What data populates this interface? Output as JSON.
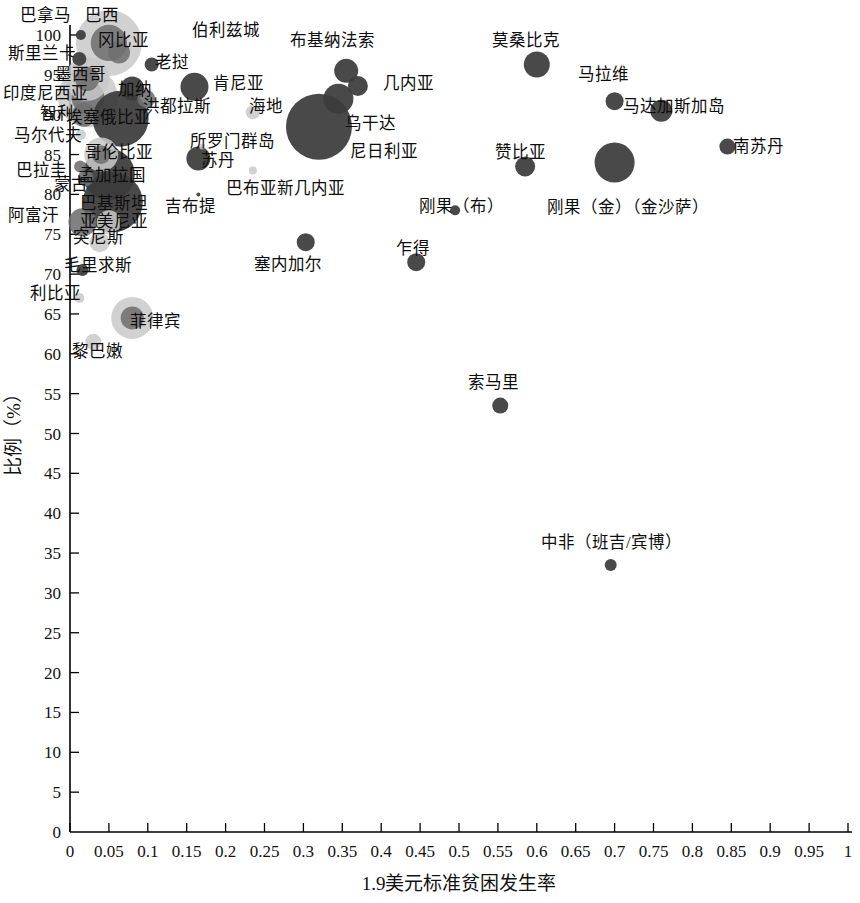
{
  "chart_data": {
    "type": "scatter",
    "title": "",
    "xlabel": "1.9美元标准贫困发生率",
    "ylabel": "比例（%）",
    "xlim": [
      0,
      1
    ],
    "ylim": [
      0,
      100
    ],
    "xticks": [
      "0",
      "0.05",
      "0.1",
      "0.15",
      "0.2",
      "0.25",
      "0.3",
      "0.35",
      "0.4",
      "0.45",
      "0.5",
      "0.55",
      "0.6",
      "0.65",
      "0.7",
      "0.75",
      "0.8",
      "0.85",
      "0.9",
      "0.95",
      "1"
    ],
    "yticks": [
      "0",
      "5",
      "10",
      "15",
      "20",
      "25",
      "30",
      "35",
      "40",
      "45",
      "50",
      "55",
      "60",
      "65",
      "70",
      "75",
      "80",
      "85",
      "90",
      "95",
      "100"
    ],
    "grid": false,
    "legend": "none",
    "bubble_note": "Bubble area encodes an unlabeled third magnitude (population scale); shades: dark, mid, light gray",
    "points": [
      {
        "label": "巴拿马",
        "x": 0.014,
        "y": 100.0,
        "r": 5,
        "shade": "dark",
        "lx": 20,
        "ly": 8
      },
      {
        "label": "巴西",
        "x": 0.05,
        "y": 99.0,
        "r": 33,
        "shade": "light",
        "lx": 85,
        "ly": 8
      },
      {
        "label": "冈比亚",
        "x": 0.063,
        "y": 97.8,
        "r": 11,
        "shade": "mid",
        "lx": 98,
        "ly": 33
      },
      {
        "label": "伯利兹城",
        "x": 0.335,
        "y": 99.0,
        "r": 3,
        "shade": "light",
        "lx": 192,
        "ly": 23
      },
      {
        "label": "布基纳法索",
        "x": 0.355,
        "y": 95.5,
        "r": 12,
        "shade": "dark",
        "lx": 290,
        "ly": 33
      },
      {
        "label": "莫桑比克",
        "x": 0.6,
        "y": 96.3,
        "r": 13,
        "shade": "dark",
        "lx": 492,
        "ly": 33
      },
      {
        "label": "斯里兰卡",
        "x": 0.012,
        "y": 97.0,
        "r": 7,
        "shade": "dark",
        "lx": 8,
        "ly": 46
      },
      {
        "label": "老挝",
        "x": 0.105,
        "y": 96.3,
        "r": 7,
        "shade": "dark",
        "lx": 155,
        "ly": 55
      },
      {
        "label": "几内亚",
        "x": 0.37,
        "y": 93.6,
        "r": 10,
        "shade": "dark",
        "lx": 383,
        "ly": 76
      },
      {
        "label": "马拉维",
        "x": 0.7,
        "y": 91.7,
        "r": 9,
        "shade": "dark",
        "lx": 578,
        "ly": 67
      },
      {
        "label": "墨西哥",
        "x": 0.022,
        "y": 94.5,
        "r": 22,
        "shade": "light",
        "lx": 55,
        "ly": 67
      },
      {
        "label": "肯尼亚",
        "x": 0.16,
        "y": 93.5,
        "r": 14,
        "shade": "dark",
        "lx": 213,
        "ly": 76
      },
      {
        "label": "加纳",
        "x": 0.08,
        "y": 93.3,
        "r": 12,
        "shade": "dark",
        "lx": 118,
        "ly": 82
      },
      {
        "label": "印度尼西亚",
        "x": 0.023,
        "y": 92.2,
        "r": 30,
        "shade": "light",
        "lx": 3,
        "ly": 86
      },
      {
        "label": "洪都拉斯",
        "x": 0.098,
        "y": 92.0,
        "r": 9,
        "shade": "mid",
        "lx": 143,
        "ly": 99
      },
      {
        "label": "海地",
        "x": 0.235,
        "y": 90.3,
        "r": 7,
        "shade": "light",
        "lx": 249,
        "ly": 99
      },
      {
        "label": "马达加斯加岛",
        "x": 0.76,
        "y": 90.5,
        "r": 11,
        "shade": "dark",
        "lx": 623,
        "ly": 99
      },
      {
        "label": "智利",
        "x": 0.018,
        "y": 90.0,
        "r": 12,
        "shade": "mid",
        "lx": 40,
        "ly": 106
      },
      {
        "label": "乌干达",
        "x": 0.345,
        "y": 92.0,
        "r": 15,
        "shade": "dark",
        "lx": 345,
        "ly": 116
      },
      {
        "label": "埃塞俄比亚",
        "x": 0.065,
        "y": 89.5,
        "r": 28,
        "shade": "dark",
        "lx": 66,
        "ly": 110
      },
      {
        "label": "尼日利亚",
        "x": 0.32,
        "y": 88.5,
        "r": 33,
        "shade": "dark",
        "lx": 350,
        "ly": 144
      },
      {
        "label": "南苏丹",
        "x": 0.845,
        "y": 86.0,
        "r": 8,
        "shade": "dark",
        "lx": 733,
        "ly": 139
      },
      {
        "label": "马尔代夫",
        "x": 0.014,
        "y": 87.5,
        "r": 5,
        "shade": "light",
        "lx": 14,
        "ly": 128
      },
      {
        "label": "所罗门群岛",
        "x": 0.17,
        "y": 86.0,
        "r": 3,
        "shade": "light",
        "lx": 190,
        "ly": 134
      },
      {
        "label": "赞比亚",
        "x": 0.585,
        "y": 83.5,
        "r": 10,
        "shade": "dark",
        "lx": 495,
        "ly": 145
      },
      {
        "label": "哥伦比亚",
        "x": 0.04,
        "y": 85.0,
        "r": 17,
        "shade": "light",
        "lx": 85,
        "ly": 145
      },
      {
        "label": "苏丹",
        "x": 0.165,
        "y": 84.5,
        "r": 12,
        "shade": "dark",
        "lx": 201,
        "ly": 153
      },
      {
        "label": "刚果（金）（金沙萨）",
        "x": 0.7,
        "y": 84.0,
        "r": 20,
        "shade": "dark",
        "lx": 547,
        "ly": 200
      },
      {
        "label": "巴拉圭",
        "x": 0.013,
        "y": 83.5,
        "r": 6,
        "shade": "mid",
        "lx": 16,
        "ly": 163
      },
      {
        "label": "蒙古",
        "x": 0.02,
        "y": 82.0,
        "r": 8,
        "shade": "mid",
        "lx": 54,
        "ly": 177
      },
      {
        "label": "孟加拉国",
        "x": 0.05,
        "y": 82.5,
        "r": 26,
        "shade": "dark",
        "lx": 78,
        "ly": 168
      },
      {
        "label": "巴布亚新几内亚",
        "x": 0.235,
        "y": 83.0,
        "r": 4,
        "shade": "light",
        "lx": 226,
        "ly": 181
      },
      {
        "label": "巴基斯坦",
        "x": 0.055,
        "y": 79.0,
        "r": 30,
        "shade": "dark",
        "lx": 80,
        "ly": 196
      },
      {
        "label": "吉布提",
        "x": 0.165,
        "y": 80.0,
        "r": 2,
        "shade": "dark",
        "lx": 165,
        "ly": 199
      },
      {
        "label": "刚果（布）",
        "x": 0.495,
        "y": 78.0,
        "r": 5,
        "shade": "dark",
        "lx": 419,
        "ly": 199
      },
      {
        "label": "阿富汗",
        "x": 0.016,
        "y": 76.5,
        "r": 14,
        "shade": "mid",
        "lx": 8,
        "ly": 208
      },
      {
        "label": "亚美尼亚",
        "x": 0.05,
        "y": 76.5,
        "r": 12,
        "shade": "light",
        "lx": 80,
        "ly": 214
      },
      {
        "label": "突尼斯",
        "x": 0.038,
        "y": 74.0,
        "r": 10,
        "shade": "light",
        "lx": 73,
        "ly": 230
      },
      {
        "label": "塞内加尔",
        "x": 0.303,
        "y": 74.0,
        "r": 9,
        "shade": "dark",
        "lx": 254,
        "ly": 257
      },
      {
        "label": "乍得",
        "x": 0.445,
        "y": 71.5,
        "r": 9,
        "shade": "dark",
        "lx": 396,
        "ly": 241
      },
      {
        "label": "毛里求斯",
        "x": 0.016,
        "y": 70.5,
        "r": 6,
        "shade": "dark",
        "lx": 64,
        "ly": 258
      },
      {
        "label": "利比亚",
        "x": 0.012,
        "y": 67.0,
        "r": 5,
        "shade": "light",
        "lx": 30,
        "ly": 286
      },
      {
        "label": "菲律宾",
        "x": 0.08,
        "y": 64.5,
        "r": 21,
        "shade": "light",
        "lx": 130,
        "ly": 314
      },
      {
        "label": "黎巴嫩",
        "x": 0.03,
        "y": 61.5,
        "r": 8,
        "shade": "light",
        "lx": 72,
        "ly": 344
      },
      {
        "label": "索马里",
        "x": 0.553,
        "y": 53.5,
        "r": 8,
        "shade": "dark",
        "lx": 468,
        "ly": 375
      },
      {
        "label": "中非（班吉/宾博）",
        "x": 0.695,
        "y": 33.5,
        "r": 6,
        "shade": "dark",
        "lx": 541,
        "ly": 535
      }
    ]
  }
}
